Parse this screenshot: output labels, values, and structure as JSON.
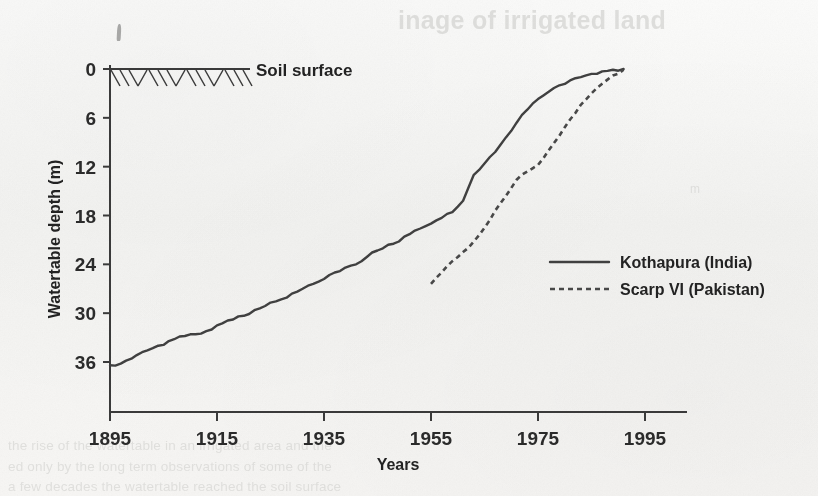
{
  "figure": {
    "background_color": "#f7f6f4",
    "ink_color": "#333333"
  },
  "annotations": {
    "soil_surface_label": "Soil surface"
  },
  "legend": {
    "position": "center-right",
    "items": [
      {
        "label": "Kothapura (India)",
        "style": "solid"
      },
      {
        "label": "Scarp VI (Pakistan)",
        "style": "dotted"
      }
    ]
  },
  "page_ghost_text": {
    "heading": "inage of irrigated land",
    "body_line_1": "the rise of the watertable in an irrigated area and the",
    "body_line_2": "ed only by the long term observations of some of the",
    "body_line_3": "a few decades the watertable reached the soil surface",
    "side_note": "m"
  },
  "chart_data": {
    "type": "line",
    "title": "",
    "xlabel": "Years",
    "ylabel": "Watertable depth (m)",
    "xlim": [
      1895,
      1995
    ],
    "ylim": [
      0,
      40
    ],
    "y_inverted": true,
    "xticks": [
      1895,
      1915,
      1935,
      1955,
      1975,
      1995
    ],
    "yticks": [
      0,
      6,
      12,
      18,
      24,
      30,
      36
    ],
    "grid": false,
    "legend_position": "center-right",
    "series": [
      {
        "name": "Kothapura (India)",
        "style": "solid",
        "x": [
          1895,
          1897,
          1899,
          1901,
          1903,
          1905,
          1907,
          1909,
          1911,
          1913,
          1915,
          1917,
          1919,
          1921,
          1923,
          1925,
          1927,
          1929,
          1931,
          1933,
          1935,
          1937,
          1939,
          1941,
          1943,
          1945,
          1947,
          1949,
          1951,
          1953,
          1955,
          1957,
          1959,
          1961,
          1963,
          1965,
          1967,
          1969,
          1971,
          1973,
          1975,
          1977,
          1979,
          1981,
          1983,
          1985,
          1987,
          1989,
          1991
        ],
        "y": [
          36.4,
          36.2,
          35.6,
          34.8,
          34.3,
          33.9,
          33.2,
          32.8,
          32.6,
          32.2,
          31.5,
          30.9,
          30.4,
          30.1,
          29.4,
          28.7,
          28.3,
          27.6,
          27.0,
          26.4,
          25.8,
          25.0,
          24.4,
          24.0,
          23.1,
          22.3,
          21.6,
          21.2,
          20.3,
          19.6,
          19.0,
          18.3,
          17.6,
          16.2,
          13.0,
          11.6,
          10.2,
          8.4,
          6.6,
          5.0,
          3.7,
          2.8,
          2.0,
          1.4,
          1.0,
          0.6,
          0.3,
          0.1,
          0.0
        ]
      },
      {
        "name": "Scarp VI (Pakistan)",
        "style": "dotted",
        "x": [
          1955,
          1957,
          1959,
          1961,
          1963,
          1965,
          1967,
          1969,
          1971,
          1973,
          1975,
          1977,
          1979,
          1981,
          1983,
          1985,
          1987,
          1989,
          1991
        ],
        "y": [
          26.4,
          25.0,
          23.6,
          22.5,
          21.2,
          19.5,
          17.4,
          15.6,
          13.6,
          12.6,
          11.8,
          10.0,
          8.2,
          6.2,
          4.4,
          3.0,
          1.8,
          0.8,
          0.1
        ]
      }
    ],
    "soil_surface": {
      "depth": 0,
      "label": "Soil surface",
      "hatched_from_x": 1895,
      "hatched_to_x": 1920
    }
  }
}
